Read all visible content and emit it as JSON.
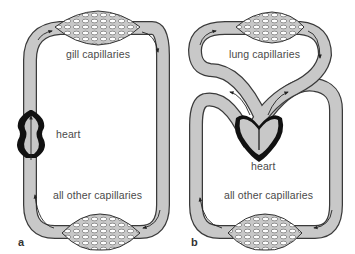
{
  "diagram": {
    "panels": [
      {
        "id": "a",
        "letter": "a",
        "description": "single circulation (fish)",
        "labels": {
          "top_capillaries": "gill capillaries",
          "heart": "heart",
          "bottom_capillaries": "all other capillaries"
        }
      },
      {
        "id": "b",
        "letter": "b",
        "description": "double circulation (mammal)",
        "labels": {
          "top_capillaries": "lung capillaries",
          "heart": "heart",
          "bottom_capillaries": "all other capillaries"
        }
      }
    ],
    "colors": {
      "vessel_fill": "#c8c8c8",
      "vessel_stroke": "#3a3a3a",
      "heart_wall": "#111111",
      "arrow": "#222222",
      "background": "#ffffff"
    }
  }
}
